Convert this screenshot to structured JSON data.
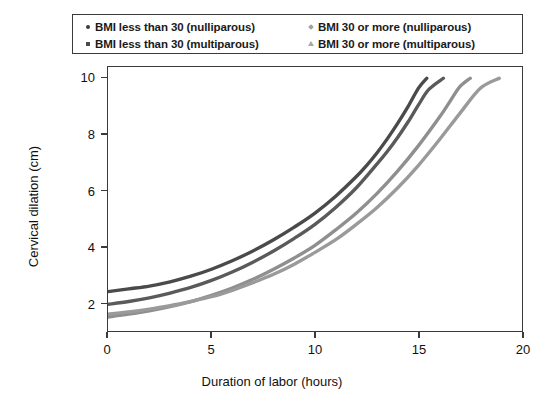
{
  "chart_data": {
    "type": "line",
    "title": "",
    "xlabel": "Duration of labor (hours)",
    "ylabel": "Cervical dilation (cm)",
    "xlim": [
      0,
      20
    ],
    "ylim": [
      1,
      10.4
    ],
    "xticks": [
      0,
      5,
      10,
      15,
      20
    ],
    "yticks": [
      2,
      4,
      6,
      8,
      10
    ],
    "grid": false,
    "legend_position": "above-plot",
    "series": [
      {
        "name": "BMI less than 30 (nulliparous)",
        "marker": "circle",
        "color": "#4a4a4a",
        "x": [
          0.0,
          1.0,
          2.0,
          3.0,
          4.0,
          5.0,
          6.0,
          7.0,
          8.0,
          9.0,
          10.0,
          11.0,
          12.0,
          12.5,
          13.0,
          13.5,
          14.0,
          14.5,
          15.0,
          15.4
        ],
        "y": [
          2.4,
          2.5,
          2.6,
          2.75,
          2.95,
          3.2,
          3.5,
          3.85,
          4.25,
          4.7,
          5.2,
          5.8,
          6.5,
          6.9,
          7.35,
          7.85,
          8.4,
          9.0,
          9.65,
          10.0
        ]
      },
      {
        "name": "BMI 30 or more (nulliparous)",
        "marker": "diamond",
        "color": "#8f8f8f",
        "x": [
          0.0,
          1.0,
          2.0,
          3.0,
          4.0,
          5.0,
          6.0,
          7.0,
          8.0,
          9.0,
          10.0,
          11.0,
          12.0,
          13.0,
          14.0,
          15.0,
          16.0,
          16.5,
          17.0,
          17.5
        ],
        "y": [
          1.5,
          1.6,
          1.72,
          1.87,
          2.05,
          2.27,
          2.53,
          2.84,
          3.2,
          3.6,
          4.05,
          4.6,
          5.2,
          5.9,
          6.7,
          7.6,
          8.6,
          9.15,
          9.7,
          10.0
        ]
      },
      {
        "name": "BMI less than 30 (multiparous)",
        "marker": "square",
        "color": "#5a5a5a",
        "x": [
          0.0,
          1.0,
          2.0,
          3.0,
          4.0,
          5.0,
          6.0,
          7.0,
          8.0,
          9.0,
          10.0,
          11.0,
          12.0,
          13.0,
          13.5,
          14.0,
          14.5,
          15.0,
          15.5,
          16.2
        ],
        "y": [
          1.95,
          2.05,
          2.18,
          2.35,
          2.55,
          2.8,
          3.1,
          3.45,
          3.85,
          4.3,
          4.8,
          5.4,
          6.1,
          6.95,
          7.4,
          7.9,
          8.45,
          9.05,
          9.6,
          10.0
        ]
      },
      {
        "name": "BMI 30 or more (multiparous)",
        "marker": "triangle",
        "color": "#9a9a9a",
        "x": [
          0.0,
          1.0,
          2.0,
          3.0,
          4.0,
          5.0,
          6.0,
          7.0,
          8.0,
          9.0,
          10.0,
          11.0,
          12.0,
          13.0,
          14.0,
          15.0,
          16.0,
          17.0,
          18.0,
          18.9
        ],
        "y": [
          1.6,
          1.68,
          1.78,
          1.9,
          2.05,
          2.22,
          2.45,
          2.72,
          3.02,
          3.38,
          3.8,
          4.25,
          4.8,
          5.4,
          6.1,
          6.9,
          7.8,
          8.75,
          9.65,
          10.0
        ]
      }
    ]
  },
  "legend": {
    "entries": [
      {
        "label": "BMI less than 30 (nulliparous)",
        "marker": "circle-marker",
        "color": "#3d3d3d"
      },
      {
        "label": "BMI less than 30 (multiparous)",
        "marker": "square-marker",
        "color": "#4a4a4a"
      },
      {
        "label": "BMI 30 or more (nulliparous)",
        "marker": "diamond-marker",
        "color": "#a0a0a0"
      },
      {
        "label": "BMI 30 or more (multiparous)",
        "marker": "triangle-marker",
        "color": "#a8a8a8"
      }
    ]
  },
  "axes": {
    "y_label": "Cervical dilation (cm)",
    "x_label": "Duration of labor (hours)",
    "y_ticks": [
      "10",
      "8",
      "6",
      "4",
      "2"
    ],
    "x_ticks": [
      "0",
      "5",
      "10",
      "15",
      "20"
    ]
  }
}
